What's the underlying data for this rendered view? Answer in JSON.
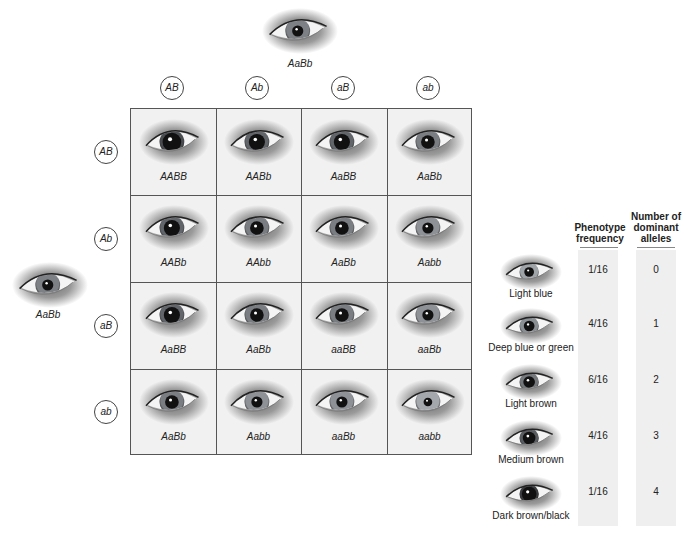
{
  "top_parent": {
    "genotype": "AaBb"
  },
  "left_parent": {
    "genotype": "AaBb"
  },
  "column_gametes": [
    "AB",
    "Ab",
    "aB",
    "ab"
  ],
  "row_gametes": [
    "AB",
    "Ab",
    "aB",
    "ab"
  ],
  "punnett": [
    [
      "AABB",
      "AABb",
      "AaBB",
      "AaBb"
    ],
    [
      "AABb",
      "AAbb",
      "AaBb",
      "Aabb"
    ],
    [
      "AaBB",
      "AaBb",
      "aaBB",
      "aaBb"
    ],
    [
      "AaBb",
      "Aabb",
      "aaBb",
      "aabb"
    ]
  ],
  "table": {
    "headers": {
      "frequency": [
        "Phenotype",
        "frequency"
      ],
      "alleles": [
        "Number of",
        "dominant",
        "alleles"
      ]
    },
    "rows": [
      {
        "phenotype": "Light blue",
        "frequency": "1/16",
        "dominant_alleles": "0",
        "iris": "#9fa4a8",
        "pupil_scale": 0.5
      },
      {
        "phenotype": "Deep blue or green",
        "frequency": "4/16",
        "dominant_alleles": "1",
        "iris": "#8a8f93",
        "pupil_scale": 0.55
      },
      {
        "phenotype": "Light brown",
        "frequency": "6/16",
        "dominant_alleles": "2",
        "iris": "#74787b",
        "pupil_scale": 0.6
      },
      {
        "phenotype": "Medium brown",
        "frequency": "4/16",
        "dominant_alleles": "3",
        "iris": "#5a5d60",
        "pupil_scale": 0.65
      },
      {
        "phenotype": "Dark brown/black",
        "frequency": "1/16",
        "dominant_alleles": "4",
        "iris": "#3a3c3e",
        "pupil_scale": 0.75
      }
    ]
  },
  "colors": {
    "grid_line": "#555555",
    "cell_bg": "#f1f1f1",
    "column_shade": "#efefef"
  }
}
